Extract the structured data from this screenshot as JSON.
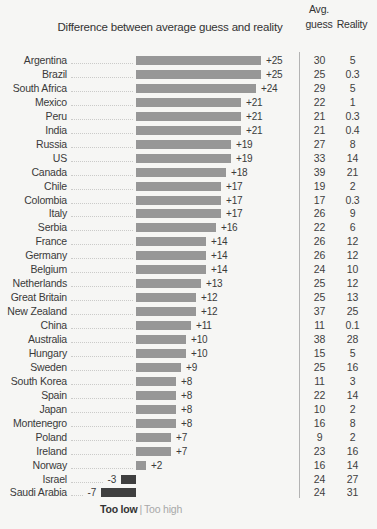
{
  "title": "Difference between average guess and reality",
  "columns": {
    "avg_line1": "Avg.",
    "avg_line2": "guess",
    "reality": "Reality"
  },
  "legend": {
    "too_low": "Too low",
    "separator": "|",
    "too_high": "Too high"
  },
  "colors": {
    "background": "#f6f6f4",
    "bar_positive": "#979797",
    "bar_negative": "#3f3f3f",
    "text": "#3a3a3a",
    "muted_text": "#a8a8a8",
    "leader_line": "#cbcbc9",
    "divider": "#b3b3b3"
  },
  "chart_data": {
    "type": "bar",
    "orientation": "horizontal",
    "title": "Difference between average guess and reality",
    "xlim": [
      -8,
      26
    ],
    "grid": false,
    "legend_position": "bottom",
    "categories": [
      "Argentina",
      "Brazil",
      "South Africa",
      "Mexico",
      "Peru",
      "India",
      "Russia",
      "US",
      "Canada",
      "Chile",
      "Colombia",
      "Italy",
      "Serbia",
      "France",
      "Germany",
      "Belgium",
      "Netherlands",
      "Great Britain",
      "New Zealand",
      "China",
      "Australia",
      "Hungary",
      "Sweden",
      "South Korea",
      "Spain",
      "Japan",
      "Montenegro",
      "Poland",
      "Ireland",
      "Norway",
      "Israel",
      "Saudi Arabia"
    ],
    "series": [
      {
        "name": "Difference between average guess and reality",
        "values": [
          25,
          25,
          24,
          21,
          21,
          21,
          19,
          19,
          18,
          17,
          17,
          17,
          16,
          14,
          14,
          14,
          13,
          12,
          12,
          11,
          10,
          10,
          9,
          8,
          8,
          8,
          8,
          7,
          7,
          2,
          -3,
          -7
        ]
      },
      {
        "name": "Avg. guess",
        "values": [
          30,
          25,
          29,
          22,
          21,
          21,
          27,
          33,
          39,
          19,
          17,
          26,
          22,
          26,
          26,
          24,
          25,
          25,
          37,
          11,
          38,
          15,
          25,
          11,
          22,
          10,
          16,
          9,
          23,
          16,
          24,
          24
        ]
      },
      {
        "name": "Reality",
        "values": [
          5,
          0.3,
          5,
          1,
          0.3,
          0.4,
          8,
          14,
          21,
          2,
          0.3,
          9,
          6,
          12,
          12,
          10,
          12,
          13,
          25,
          0.1,
          28,
          5,
          16,
          3,
          14,
          2,
          8,
          2,
          16,
          14,
          27,
          31
        ]
      }
    ]
  }
}
